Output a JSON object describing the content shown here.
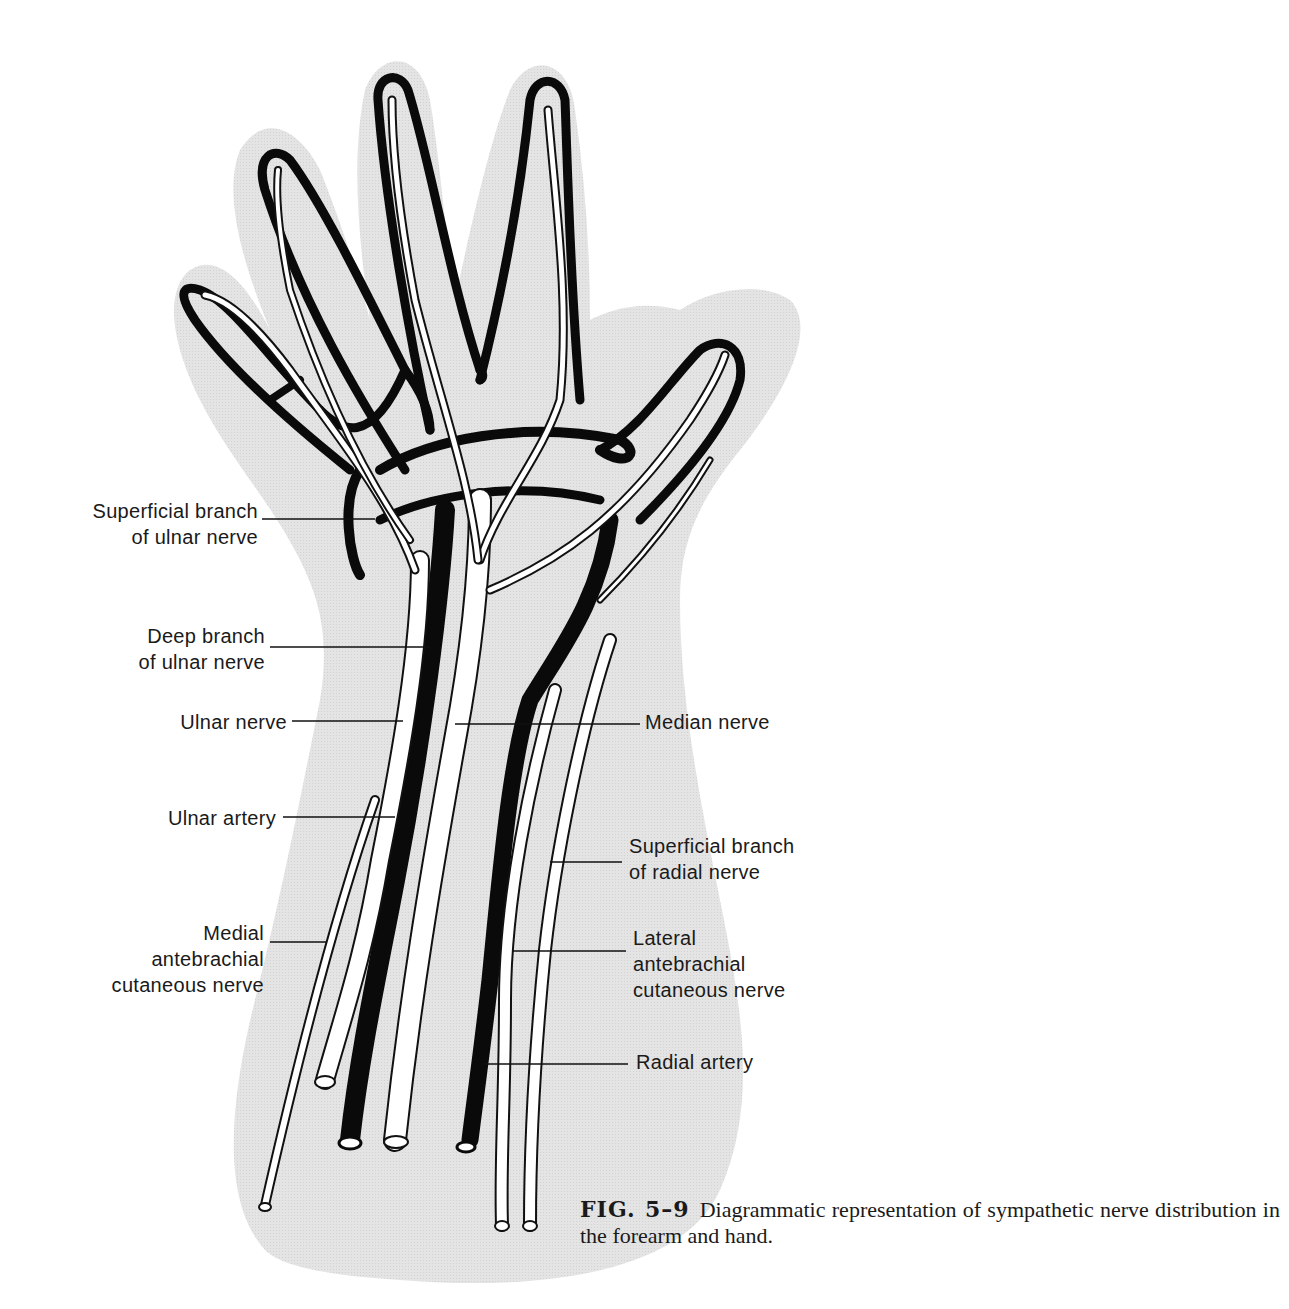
{
  "page": {
    "page_number_fragment": ""
  },
  "figure": {
    "title": "Diagrammatic representation of sympathetic nerve distribution in the forearm and hand",
    "colors": {
      "background": "#ffffff",
      "skin_silhouette": "#e3e3e3",
      "artery": "#0a0a0a",
      "nerve_fill": "#ffffff",
      "outline": "#111111"
    },
    "labels_left": [
      {
        "id": "superficial-branch-ulnar",
        "text": "Superficial branch\nof ulnar nerve"
      },
      {
        "id": "deep-branch-ulnar",
        "text": "Deep branch\nof ulnar nerve"
      },
      {
        "id": "ulnar-nerve",
        "text": "Ulnar nerve"
      },
      {
        "id": "ulnar-artery",
        "text": "Ulnar artery"
      },
      {
        "id": "medial-antebrachial",
        "text": "Medial\nantebrachial\ncutaneous nerve"
      }
    ],
    "labels_right": [
      {
        "id": "median-nerve",
        "text": "Median nerve"
      },
      {
        "id": "superficial-branch-radial",
        "text": "Superficial branch\nof radial nerve"
      },
      {
        "id": "lateral-antebrachial",
        "text": "Lateral\nantebrachial\ncutaneous nerve"
      },
      {
        "id": "radial-artery",
        "text": "Radial artery"
      }
    ]
  },
  "caption": {
    "figure_number": "FIG. 5–9",
    "text": "Diagrammatic representation of sympathetic nerve distribution in the forearm and hand."
  }
}
